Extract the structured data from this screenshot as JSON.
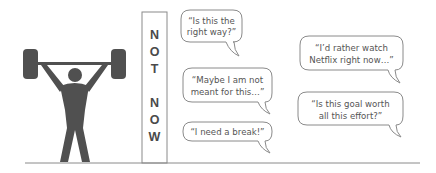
{
  "illustration": {
    "figure": {
      "label": "weightlifter figure lifting barbell overhead",
      "color": "#505050"
    },
    "column": {
      "letters": [
        "N",
        "O",
        "T",
        "N",
        "O",
        "W"
      ],
      "text": "NOT NOW",
      "border_color": "#8a8a8a",
      "text_color": "#4a4a4a"
    },
    "ground_line_color": "#8a8a8a",
    "bubble_border_color": "#8a8a8a",
    "bubble_text_color": "#555555",
    "bubbles": [
      {
        "lines": [
          "“Is this the",
          "right way?”"
        ]
      },
      {
        "lines": [
          "“Maybe I am not",
          "meant for this…”"
        ]
      },
      {
        "lines": [
          "“I need a break!”"
        ]
      },
      {
        "lines": [
          "“I’d rather watch",
          "Netflix right now…”"
        ]
      },
      {
        "lines": [
          "“Is this goal worth",
          "all this effort?”"
        ]
      }
    ]
  }
}
